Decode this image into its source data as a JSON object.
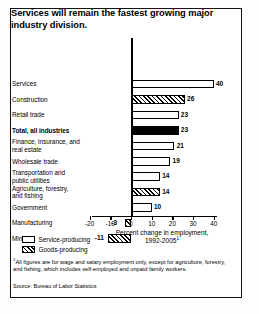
{
  "chart_data": {
    "type": "bar",
    "orientation": "horizontal",
    "title": "Services will remain the fastest growing major industry division.",
    "xlabel": "Percent change in employment, 1992-2005",
    "xlabel_line1": "Percent change in employment,",
    "xlabel_line2": "1992-2005",
    "xlabel_footnote_marker": "1",
    "ylabel": "",
    "xlim": [
      -20,
      40
    ],
    "xticks": [
      -20,
      -10,
      0,
      10,
      20,
      30,
      40
    ],
    "xticklabels": [
      "-20",
      "-10",
      "0",
      "10",
      "20",
      "30",
      "40"
    ],
    "grid": false,
    "categories": [
      "Services",
      "Construction",
      "Retail trade",
      "Total, all industries",
      "Finance, insurance, and real estate",
      "Wholesale trade",
      "Transportation and public utilities",
      "Agriculture, forestry, and fishing",
      "Government",
      "Manufacturing",
      "Mining"
    ],
    "values": [
      40,
      26,
      23,
      23,
      21,
      19,
      14,
      14,
      10,
      -3,
      -11
    ],
    "value_labels": [
      "40",
      "26",
      "23",
      "23",
      "21",
      "19",
      "14",
      "14",
      "10",
      "-3",
      "-11"
    ],
    "bar_groups": [
      "service",
      "goods",
      "service",
      "total",
      "service",
      "service",
      "service",
      "goods",
      "service",
      "goods",
      "goods"
    ],
    "legend": {
      "position": "bottom-left",
      "entries": [
        {
          "label": "Service-producing",
          "pattern": "open-white-box"
        },
        {
          "label": "Goods-producing",
          "pattern": "diagonal-hatch-box"
        }
      ]
    },
    "annotations": {
      "footnote": "All figures are for wage and salary employment only, except for agriculture, forestry, and fishing, which includes self-employed and unpaid family workers.",
      "footnote_marker": "1",
      "source": "Source: Bureau of Labor Statistics"
    }
  },
  "rows": [
    {
      "label_line1": "Services",
      "label_line2": "",
      "value_label": "40"
    },
    {
      "label_line1": "Construction",
      "label_line2": "",
      "value_label": "26"
    },
    {
      "label_line1": "Retail trade",
      "label_line2": "",
      "value_label": "23"
    },
    {
      "label_line1": "Total, all industries",
      "label_line2": "",
      "value_label": "23"
    },
    {
      "label_line1": "Finance, insurance, and",
      "label_line2": "real estate",
      "value_label": "21"
    },
    {
      "label_line1": "Wholesale trade",
      "label_line2": "",
      "value_label": "19"
    },
    {
      "label_line1": "Transportation and",
      "label_line2": "public utilities",
      "value_label": "14"
    },
    {
      "label_line1": "Agriculture, forestry,",
      "label_line2": "and fishing",
      "value_label": "14"
    },
    {
      "label_line1": "Government",
      "label_line2": "",
      "value_label": "10"
    },
    {
      "label_line1": "Manufacturing",
      "label_line2": "",
      "value_label": "-3"
    },
    {
      "label_line1": "Mining",
      "label_line2": "",
      "value_label": "-11"
    }
  ],
  "ticks": [
    {
      "label": "-20"
    },
    {
      "label": "-10"
    },
    {
      "label": "0"
    },
    {
      "label": "10"
    },
    {
      "label": "20"
    },
    {
      "label": "30"
    },
    {
      "label": "40"
    }
  ],
  "colors": {
    "ink": "#000000",
    "paper": "#ffffff"
  }
}
